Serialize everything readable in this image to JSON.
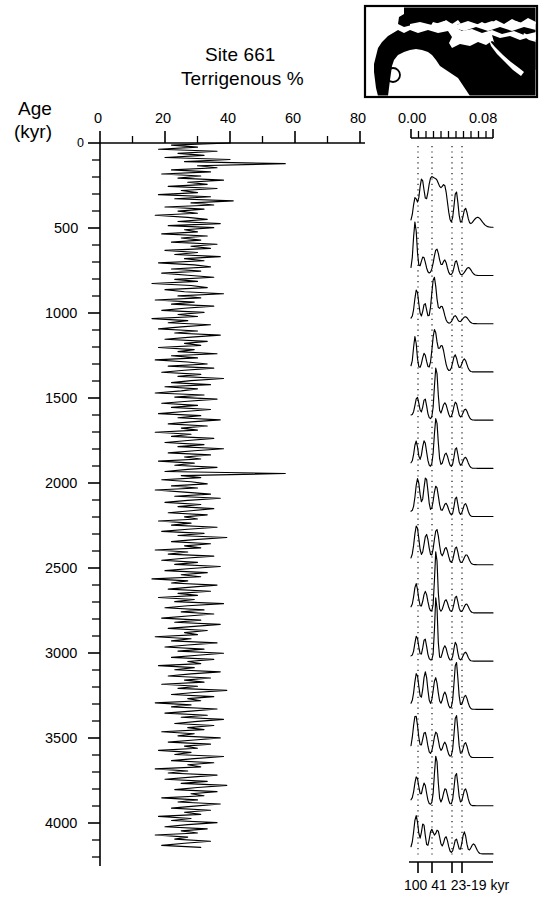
{
  "figure": {
    "title_line1": "Site 661",
    "title_line2": "Terrigenous %",
    "age_axis_label_line1": "Age",
    "age_axis_label_line2": "(kyr)"
  },
  "left_panel": {
    "x_axis_ticks": [
      "0",
      "20",
      "40",
      "60",
      "80"
    ],
    "y_axis_ticks": [
      "0",
      "500",
      "1000",
      "1500",
      "2000",
      "2500",
      "3000",
      "3500",
      "4000"
    ]
  },
  "right_panel": {
    "x_axis_ticks": [
      "0.00",
      "0.08"
    ],
    "period_labels": "100 41 23-19 kyr",
    "period_label_parts": [
      "100",
      "41",
      "23-19",
      "kyr"
    ]
  },
  "inset_map": {
    "name": "africa-locator-map",
    "site_marker": "site-661-location-circle"
  },
  "colors": {
    "ink": "#000000",
    "background": "#ffffff",
    "land": "#000000"
  },
  "chart_data": [
    {
      "type": "line",
      "name": "terrigenous-percent-vs-age",
      "title": "Site 661 Terrigenous %",
      "xlabel": "Terrigenous %",
      "ylabel": "Age (kyr)",
      "xlim": [
        0,
        80
      ],
      "ylim": [
        0,
        4200
      ],
      "y_inverted": true,
      "xticks": [
        0,
        20,
        40,
        60,
        80
      ],
      "xticks_minor_step": 10,
      "yticks": [
        0,
        500,
        1000,
        1500,
        2000,
        2500,
        3000,
        3500,
        4000
      ],
      "yticks_minor_step": 100,
      "grid": false,
      "legend": "none",
      "x": [
        0,
        12,
        24,
        36,
        48,
        60,
        72,
        84,
        96,
        108,
        120,
        132,
        144,
        156,
        168,
        180,
        192,
        204,
        216,
        228,
        240,
        252,
        264,
        276,
        288,
        300,
        312,
        324,
        336,
        348,
        360,
        372,
        384,
        396,
        408,
        420,
        432,
        444,
        456,
        468,
        480,
        492,
        504,
        516,
        528,
        540,
        552,
        564,
        576,
        588,
        600,
        612,
        624,
        636,
        648,
        660,
        672,
        684,
        696,
        708,
        720,
        732,
        744,
        756,
        768,
        780,
        792,
        804,
        816,
        828,
        840,
        852,
        864,
        876,
        888,
        900,
        912,
        924,
        936,
        948,
        960,
        972,
        984,
        996,
        1008,
        1020,
        1032,
        1044,
        1056,
        1068,
        1080,
        1092,
        1104,
        1116,
        1128,
        1140,
        1152,
        1164,
        1176,
        1188,
        1200,
        1212,
        1224,
        1236,
        1248,
        1260,
        1272,
        1284,
        1296,
        1308,
        1320,
        1332,
        1344,
        1356,
        1368,
        1380,
        1392,
        1404,
        1416,
        1428,
        1440,
        1452,
        1464,
        1476,
        1488,
        1500,
        1512,
        1524,
        1536,
        1548,
        1560,
        1572,
        1584,
        1596,
        1608,
        1620,
        1632,
        1644,
        1656,
        1668,
        1680,
        1692,
        1704,
        1716,
        1728,
        1740,
        1752,
        1764,
        1776,
        1788,
        1800,
        1812,
        1824,
        1836,
        1848,
        1860,
        1872,
        1884,
        1896,
        1908,
        1920,
        1932,
        1944,
        1956,
        1968,
        1980,
        1992,
        2004,
        2016,
        2028,
        2040,
        2052,
        2064,
        2076,
        2088,
        2100,
        2112,
        2124,
        2136,
        2148,
        2160,
        2172,
        2184,
        2196,
        2208,
        2220,
        2232,
        2244,
        2256,
        2268,
        2280,
        2292,
        2304,
        2316,
        2328,
        2340,
        2352,
        2364,
        2376,
        2388,
        2400,
        2412,
        2424,
        2436,
        2448,
        2460,
        2472,
        2484,
        2496,
        2508,
        2520,
        2532,
        2544,
        2556,
        2568,
        2580,
        2592,
        2604,
        2616,
        2628,
        2640,
        2652,
        2664,
        2676,
        2688,
        2700,
        2712,
        2724,
        2736,
        2748,
        2760,
        2772,
        2784,
        2796,
        2808,
        2820,
        2832,
        2844,
        2856,
        2868,
        2880,
        2892,
        2904,
        2916,
        2928,
        2940,
        2952,
        2964,
        2976,
        2988,
        3000,
        3012,
        3024,
        3036,
        3048,
        3060,
        3072,
        3084,
        3096,
        3108,
        3120,
        3132,
        3144,
        3156,
        3168,
        3180,
        3192,
        3204,
        3216,
        3228,
        3240,
        3252,
        3264,
        3276,
        3288,
        3300,
        3312,
        3324,
        3336,
        3348,
        3360,
        3372,
        3384,
        3396,
        3408,
        3420,
        3432,
        3444,
        3456,
        3468,
        3480,
        3492,
        3504,
        3516,
        3528,
        3540,
        3552,
        3564,
        3576,
        3588,
        3600,
        3612,
        3624,
        3636,
        3648,
        3660,
        3672,
        3684,
        3696,
        3708,
        3720,
        3732,
        3744,
        3756,
        3768,
        3780,
        3792,
        3804,
        3816,
        3828,
        3840,
        3852,
        3864,
        3876,
        3888,
        3900,
        3912,
        3924,
        3936,
        3948,
        3960,
        3972,
        3984,
        3996,
        4008,
        4020,
        4032,
        4044,
        4056,
        4068,
        4080,
        4092,
        4104,
        4116,
        4128,
        4140,
        4152,
        4164,
        4176,
        4188
      ],
      "values": [
        40,
        22,
        30,
        18,
        36,
        24,
        32,
        20,
        40,
        26,
        57,
        30,
        36,
        22,
        34,
        19,
        31,
        24,
        38,
        27,
        33,
        21,
        36,
        25,
        30,
        18,
        34,
        23,
        41,
        28,
        35,
        20,
        32,
        24,
        30,
        17,
        27,
        33,
        24,
        37,
        21,
        35,
        26,
        30,
        19,
        33,
        25,
        31,
        22,
        36,
        28,
        34,
        20,
        30,
        23,
        37,
        26,
        32,
        18,
        29,
        34,
        22,
        31,
        19,
        27,
        35,
        23,
        30,
        16,
        28,
        33,
        20,
        26,
        38,
        24,
        31,
        17,
        29,
        22,
        35,
        26,
        19,
        32,
        24,
        30,
        16,
        27,
        21,
        34,
        25,
        18,
        30,
        23,
        37,
        28,
        20,
        33,
        26,
        31,
        18,
        29,
        24,
        36,
        22,
        30,
        17,
        27,
        33,
        21,
        35,
        26,
        19,
        31,
        24,
        38,
        28,
        22,
        34,
        20,
        30,
        25,
        17,
        32,
        23,
        36,
        27,
        19,
        30,
        22,
        34,
        26,
        18,
        31,
        24,
        37,
        28,
        21,
        33,
        25,
        30,
        17,
        28,
        22,
        35,
        27,
        20,
        32,
        24,
        38,
        29,
        21,
        34,
        26,
        31,
        18,
        29,
        23,
        36,
        27,
        20,
        57,
        25,
        31,
        19,
        28,
        33,
        22,
        30,
        17,
        26,
        34,
        23,
        37,
        27,
        20,
        31,
        24,
        35,
        28,
        21,
        33,
        26,
        30,
        18,
        28,
        22,
        36,
        27,
        19,
        32,
        24,
        39,
        29,
        22,
        34,
        26,
        31,
        17,
        27,
        21,
        35,
        26,
        19,
        30,
        23,
        37,
        28,
        20,
        33,
        25,
        31,
        16,
        27,
        22,
        36,
        28,
        21,
        34,
        24,
        30,
        18,
        29,
        23,
        38,
        27,
        20,
        32,
        25,
        35,
        27,
        19,
        31,
        23,
        37,
        29,
        21,
        33,
        26,
        30,
        17,
        28,
        22,
        36,
        27,
        20,
        32,
        24,
        38,
        30,
        22,
        35,
        27,
        31,
        18,
        29,
        23,
        37,
        28,
        21,
        34,
        26,
        32,
        19,
        30,
        24,
        39,
        29,
        22,
        35,
        27,
        31,
        17,
        28,
        22,
        36,
        28,
        20,
        33,
        25,
        38,
        30,
        23,
        35,
        27,
        32,
        19,
        29,
        24,
        37,
        29,
        21,
        34,
        26,
        30,
        18,
        28,
        23,
        38,
        29,
        22,
        35,
        27,
        31,
        17,
        27,
        21,
        36,
        28,
        20,
        33,
        25,
        39,
        30,
        23,
        36,
        28,
        32,
        19,
        30,
        24,
        37,
        29,
        22,
        34,
        26,
        31,
        18,
        28,
        22,
        36,
        27,
        20,
        33,
        25,
        30,
        17,
        27,
        23,
        34,
        26,
        19,
        31
      ]
    },
    {
      "type": "line",
      "name": "evolutive-power-spectra",
      "title": "Evolutive spectra of terrigenous %",
      "xlabel": "Frequency (cycles / kyr)",
      "xlim": [
        0.0,
        0.08
      ],
      "xticks": [
        0.0,
        0.08
      ],
      "xticks_minor_count": 11,
      "orbital_period_markers_kyr": [
        100,
        41,
        23,
        19
      ],
      "orbital_marker_frequencies": [
        0.01,
        0.0244,
        0.0435,
        0.0526
      ],
      "grid": "vertical-dotted-at-orbital-periods",
      "legend": "none",
      "n_spectra": 15,
      "spectra_baseline_ages_kyr": [
        500,
        780,
        1060,
        1340,
        1620,
        1900,
        2180,
        2460,
        2740,
        3020,
        3300,
        3580,
        3860,
        4140,
        4300
      ],
      "note": "Stacked power spectra; each trace baseline placed at its window age"
    }
  ]
}
